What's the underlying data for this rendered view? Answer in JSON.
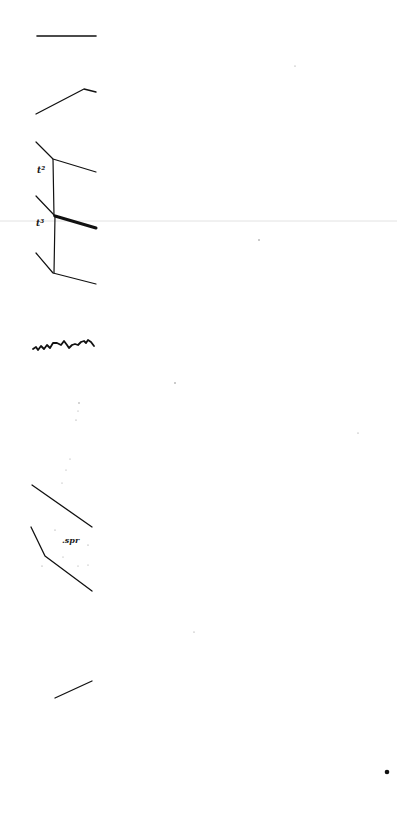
{
  "page": {
    "background": "#ffffff",
    "ink_color": "#111111",
    "width": 397,
    "height": 819
  },
  "annotations": {
    "upper_label": "t²",
    "middle_label": "t³",
    "lower_label": ".spr"
  }
}
